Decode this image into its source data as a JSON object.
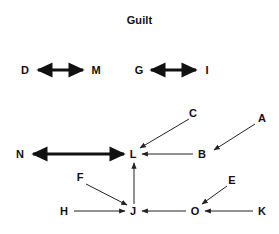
{
  "title": "Guilt",
  "colors": {
    "background": "#ffffff",
    "text": "#111111",
    "edge_bold": "#111111",
    "edge_thin": "#222222"
  },
  "diagram": {
    "type": "directed-graph",
    "width": 279,
    "height": 234,
    "nodes": [
      {
        "id": "D",
        "label": "D",
        "x": 25,
        "y": 70
      },
      {
        "id": "M",
        "label": "M",
        "x": 96,
        "y": 70
      },
      {
        "id": "G",
        "label": "G",
        "x": 139,
        "y": 70
      },
      {
        "id": "I",
        "label": "I",
        "x": 207,
        "y": 70
      },
      {
        "id": "C",
        "label": "C",
        "x": 193,
        "y": 113
      },
      {
        "id": "A",
        "label": "A",
        "x": 262,
        "y": 118
      },
      {
        "id": "N",
        "label": "N",
        "x": 20,
        "y": 154
      },
      {
        "id": "L",
        "label": "L",
        "x": 133,
        "y": 154
      },
      {
        "id": "B",
        "label": "B",
        "x": 202,
        "y": 154
      },
      {
        "id": "F",
        "label": "F",
        "x": 80,
        "y": 177
      },
      {
        "id": "E",
        "label": "E",
        "x": 232,
        "y": 180
      },
      {
        "id": "H",
        "label": "H",
        "x": 64,
        "y": 211
      },
      {
        "id": "J",
        "label": "J",
        "x": 133,
        "y": 211
      },
      {
        "id": "O",
        "label": "O",
        "x": 195,
        "y": 211
      },
      {
        "id": "K",
        "label": "K",
        "x": 262,
        "y": 211
      }
    ],
    "edges": [
      {
        "id": "D-M",
        "from": "D",
        "to": "M",
        "direction": "both",
        "weight": "bold",
        "x1": 38,
        "y1": 70,
        "x2": 83,
        "y2": 70
      },
      {
        "id": "G-I",
        "from": "G",
        "to": "I",
        "direction": "both",
        "weight": "bold",
        "x1": 151,
        "y1": 70,
        "x2": 196,
        "y2": 70
      },
      {
        "id": "N-L",
        "from": "N",
        "to": "L",
        "direction": "both",
        "weight": "bold",
        "x1": 33,
        "y1": 154,
        "x2": 124,
        "y2": 154
      },
      {
        "id": "C-L",
        "from": "C",
        "to": "L",
        "direction": "forward",
        "weight": "thin",
        "x1": 189,
        "y1": 119,
        "x2": 140,
        "y2": 148
      },
      {
        "id": "A-B",
        "from": "A",
        "to": "B",
        "direction": "forward",
        "weight": "thin",
        "x1": 255,
        "y1": 124,
        "x2": 214,
        "y2": 150
      },
      {
        "id": "B-L",
        "from": "B",
        "to": "L",
        "direction": "forward",
        "weight": "thin",
        "x1": 193,
        "y1": 154,
        "x2": 142,
        "y2": 154
      },
      {
        "id": "F-J",
        "from": "F",
        "to": "J",
        "direction": "forward",
        "weight": "thin",
        "x1": 86,
        "y1": 184,
        "x2": 127,
        "y2": 205
      },
      {
        "id": "H-J",
        "from": "H",
        "to": "J",
        "direction": "forward",
        "weight": "thin",
        "x1": 74,
        "y1": 211,
        "x2": 125,
        "y2": 211
      },
      {
        "id": "J-L",
        "from": "J",
        "to": "L",
        "direction": "forward",
        "weight": "thin",
        "x1": 134,
        "y1": 204,
        "x2": 134,
        "y2": 163
      },
      {
        "id": "O-J",
        "from": "O",
        "to": "J",
        "direction": "forward",
        "weight": "thin",
        "x1": 186,
        "y1": 211,
        "x2": 142,
        "y2": 211
      },
      {
        "id": "E-O",
        "from": "E",
        "to": "O",
        "direction": "forward",
        "weight": "thin",
        "x1": 227,
        "y1": 186,
        "x2": 202,
        "y2": 204
      },
      {
        "id": "K-O",
        "from": "K",
        "to": "O",
        "direction": "forward",
        "weight": "thin",
        "x1": 253,
        "y1": 211,
        "x2": 205,
        "y2": 211
      }
    ]
  }
}
